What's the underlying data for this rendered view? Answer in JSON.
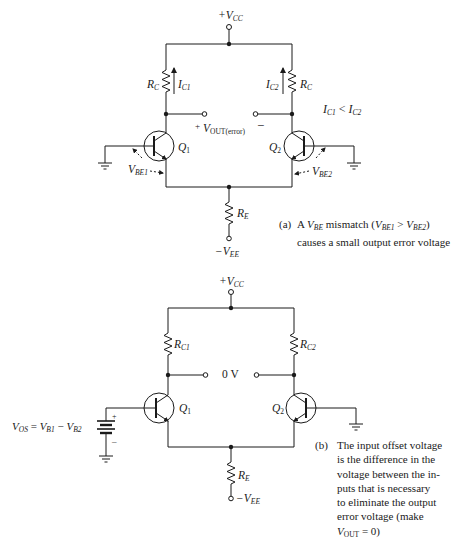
{
  "diagram_a": {
    "vcc": {
      "prefix": "+V",
      "sub": "CC"
    },
    "rc_left": {
      "main": "R",
      "sub": "C"
    },
    "rc_right": {
      "main": "R",
      "sub": "C"
    },
    "ic1": {
      "main": "I",
      "sub": "C1"
    },
    "ic2": {
      "main": "I",
      "sub": "C2"
    },
    "current_relation": {
      "a_main": "I",
      "a_sub": "C1",
      "op": " < ",
      "b_main": "I",
      "b_sub": "C2"
    },
    "vout": {
      "plus": "+",
      "main": "V",
      "sub": "OUT(error)",
      "minus": "–"
    },
    "q1": {
      "main": "Q",
      "sub": "1"
    },
    "q2": {
      "main": "Q",
      "sub": "2"
    },
    "vbe1": {
      "main": "V",
      "sub": "BE1"
    },
    "vbe2": {
      "main": "V",
      "sub": "BE2"
    },
    "re": {
      "main": "R",
      "sub": "E"
    },
    "vee": {
      "prefix": "−V",
      "sub": "EE"
    },
    "caption": {
      "tag": "(a)",
      "line1_pre": "A ",
      "line1_v": "V",
      "line1_vsub": "BE",
      "line1_mid": " mismatch (",
      "line1_a": "V",
      "line1_asub": "BE1",
      "line1_op": " > ",
      "line1_b": "V",
      "line1_bsub": "BE2",
      "line1_end": ")",
      "line2": "causes a small output error voltage"
    }
  },
  "diagram_b": {
    "vcc": {
      "prefix": "+V",
      "sub": "CC"
    },
    "rc1": {
      "main": "R",
      "sub": "C1"
    },
    "rc2": {
      "main": "R",
      "sub": "C2"
    },
    "output_voltage": "0 V",
    "q1": {
      "main": "Q",
      "sub": "1"
    },
    "q2": {
      "main": "Q",
      "sub": "2"
    },
    "re": {
      "main": "R",
      "sub": "E"
    },
    "vee": {
      "prefix": "−V",
      "sub": "EE"
    },
    "battery": {
      "plus": "+",
      "minus": "–"
    },
    "vos_equation": {
      "lhs": "V",
      "lhs_sub": "OS",
      "eq": " = ",
      "a": "V",
      "a_sub": "B1",
      "op": " − ",
      "b": "V",
      "b_sub": "B2"
    },
    "caption": {
      "tag": "(b)",
      "lines": [
        "The input offset voltage",
        "is the difference in the",
        "voltage between the in-",
        "puts that is necessary",
        "to eliminate the output",
        "error voltage (make"
      ],
      "last_v": "V",
      "last_vsub": "OUT",
      "last_rest": " = 0)"
    }
  },
  "colors": {
    "ink": "#1a1a1a",
    "background": "#ffffff"
  }
}
